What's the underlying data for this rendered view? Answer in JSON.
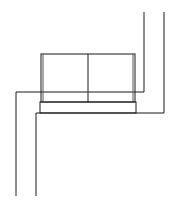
{
  "diagram": {
    "type": "line-drawing",
    "stroke_color": "#1a1a1a",
    "background": "#ffffff",
    "walls": {
      "outer_path": [
        [
          16,
          196
        ],
        [
          16,
          92
        ],
        [
          144,
          92
        ],
        [
          144,
          12
        ]
      ],
      "inner_path": [
        [
          36,
          196
        ],
        [
          36,
          113
        ],
        [
          164,
          113
        ],
        [
          164,
          12
        ]
      ]
    },
    "sofa": {
      "back_rect": {
        "x": 41,
        "y": 54,
        "w": 94,
        "h": 48
      },
      "divider_x": 88,
      "base_rect": {
        "x": 40,
        "y": 102,
        "w": 96,
        "h": 11
      },
      "cushion_count": 2
    }
  }
}
